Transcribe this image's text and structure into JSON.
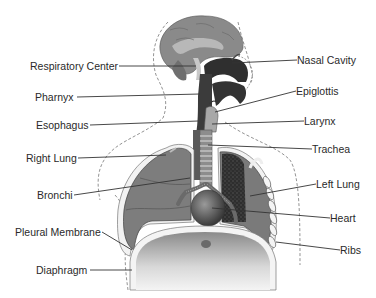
{
  "diagram": {
    "labels_left": [
      {
        "id": "respiratory-center",
        "text": "Respiratory Center",
        "x": 30,
        "y": 60
      },
      {
        "id": "pharynx",
        "text": "Pharnyx",
        "x": 35,
        "y": 91
      },
      {
        "id": "esophagus",
        "text": "Esophagus",
        "x": 36,
        "y": 119
      },
      {
        "id": "right-lung",
        "text": "Right Lung",
        "x": 26,
        "y": 152
      },
      {
        "id": "bronchi",
        "text": "Bronchi",
        "x": 37,
        "y": 188
      },
      {
        "id": "pleural-membrane",
        "text": "Pleural Membrane",
        "x": 15,
        "y": 225
      },
      {
        "id": "diaphragm",
        "text": "Diaphragm",
        "x": 36,
        "y": 264
      }
    ],
    "labels_right": [
      {
        "id": "nasal-cavity",
        "text": "Nasal Cavity",
        "x": 297,
        "y": 54
      },
      {
        "id": "epiglottis",
        "text": "Epiglottis",
        "x": 296,
        "y": 85
      },
      {
        "id": "larynx",
        "text": "Larynx",
        "x": 304,
        "y": 115
      },
      {
        "id": "trachea",
        "text": "Trachea",
        "x": 312,
        "y": 143
      },
      {
        "id": "left-lung",
        "text": "Left Lung",
        "x": 316,
        "y": 178
      },
      {
        "id": "heart",
        "text": "Heart",
        "x": 330,
        "y": 212
      },
      {
        "id": "ribs",
        "text": "Ribs",
        "x": 340,
        "y": 244
      }
    ]
  },
  "colors": {
    "lung": "#7a7a7a",
    "lung_dark": "#3a3a3a",
    "brain": "#8c8c8c",
    "airway_dark": "#4a4a4a",
    "diaphragm": "#bdbdbd",
    "line": "#333333",
    "text": "#2a2a2a",
    "outline": "#9a9a9a"
  }
}
